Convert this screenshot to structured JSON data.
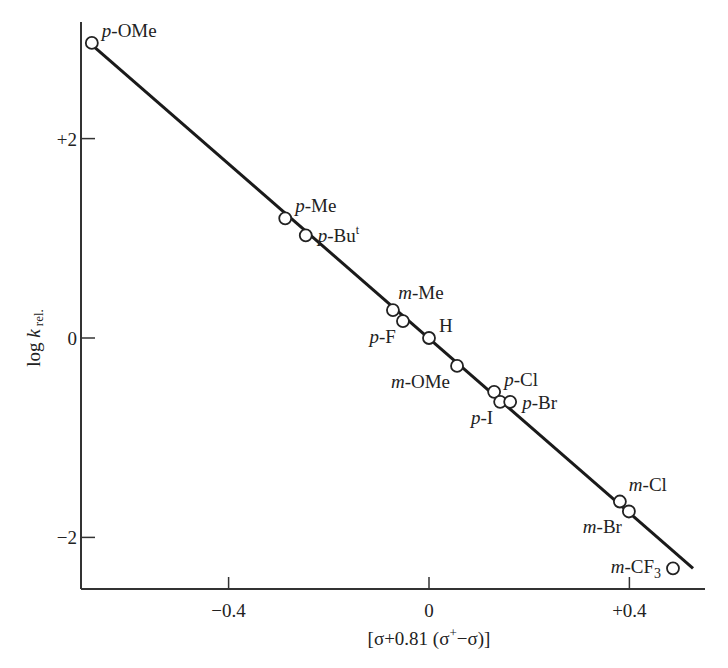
{
  "chart_data": {
    "type": "scatter",
    "title": "",
    "xlabel": "[σ+0.81 (σ⁺−σ)]",
    "xlabel_parts": {
      "pre": "[σ+0.81 (σ",
      "sup": "+",
      "post": "−σ)]"
    },
    "ylabel": "log k rel.",
    "ylabel_parts": {
      "pre": "log ",
      "italic": "k",
      "sub": " rel."
    },
    "xlim": [
      -0.705,
      0.545
    ],
    "ylim": [
      -2.52,
      3.4
    ],
    "x_ticks": [
      {
        "value": -0.4,
        "label": "−0.4"
      },
      {
        "value": 0,
        "label": "0"
      },
      {
        "value": 0.4,
        "label": "+0.4"
      }
    ],
    "y_ticks": [
      {
        "value": 2,
        "label": "+2"
      },
      {
        "value": 0,
        "label": "0"
      },
      {
        "value": -2,
        "label": "−2"
      }
    ],
    "grid": false,
    "legend": "none",
    "points": [
      {
        "name": "p-OMe",
        "prefix": "p",
        "rest": "-OMe",
        "x": -0.673,
        "y": 2.96,
        "label_side": "right-up"
      },
      {
        "name": "p-Me",
        "prefix": "p",
        "rest": "-Me",
        "x": -0.287,
        "y": 1.2,
        "label_side": "right-up"
      },
      {
        "name": "p-Bu^t",
        "prefix": "p",
        "rest": "-Bu",
        "sup": "t",
        "x": -0.246,
        "y": 1.03,
        "label_side": "right"
      },
      {
        "name": "m-Me",
        "prefix": "m",
        "rest": "-Me",
        "x": -0.072,
        "y": 0.28,
        "label_side": "up"
      },
      {
        "name": "p-F",
        "prefix": "p",
        "rest": "-F",
        "x": -0.052,
        "y": 0.17,
        "label_side": "left-down"
      },
      {
        "name": "H",
        "prefix": "",
        "rest": "H",
        "x": 0.0,
        "y": 0.0,
        "label_side": "right-up"
      },
      {
        "name": "m-OMe",
        "prefix": "m",
        "rest": "-OMe",
        "x": 0.056,
        "y": -0.28,
        "label_side": "left-down"
      },
      {
        "name": "p-Cl",
        "prefix": "p",
        "rest": "-Cl",
        "x": 0.13,
        "y": -0.54,
        "label_side": "right-up"
      },
      {
        "name": "p-I",
        "prefix": "p",
        "rest": "-I",
        "x": 0.142,
        "y": -0.64,
        "label_side": "left-down"
      },
      {
        "name": "p-Br",
        "prefix": "p",
        "rest": "-Br",
        "x": 0.162,
        "y": -0.64,
        "label_side": "right"
      },
      {
        "name": "m-Cl",
        "prefix": "m",
        "rest": "-Cl",
        "x": 0.381,
        "y": -1.64,
        "label_side": "up"
      },
      {
        "name": "m-Br",
        "prefix": "m",
        "rest": "-Br",
        "x": 0.399,
        "y": -1.74,
        "label_side": "left-down"
      },
      {
        "name": "m-CF3",
        "prefix": "m",
        "rest": "-CF",
        "sub": "3",
        "x": 0.487,
        "y": -2.31,
        "label_side": "left"
      }
    ],
    "fit_line": {
      "x1": -0.673,
      "y1": 2.94,
      "x2": 0.527,
      "y2": -2.31,
      "slope_rho": -4.37
    }
  }
}
